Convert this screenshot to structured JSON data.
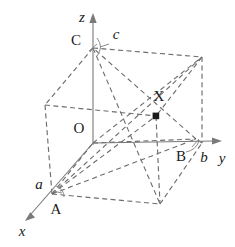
{
  "figure": {
    "background_color": "#ffffff",
    "line_color": "#6d6d6d",
    "axis_color": "#7a7a7a",
    "label_color": "#1c1c1c",
    "point_color": "#1a1a1a"
  },
  "axes": [
    {
      "id": "axis-x",
      "label": "x",
      "style": "italic",
      "label_x": 22,
      "label_y": 233,
      "from": [
        93,
        143
      ],
      "to": [
        27,
        219
      ],
      "arrow": true
    },
    {
      "id": "axis-y",
      "label": "y",
      "style": "italic",
      "label_x": 222,
      "label_y": 160,
      "from": [
        93,
        143
      ],
      "to": [
        222,
        141
      ],
      "arrow": true
    },
    {
      "id": "axis-z",
      "label": "z",
      "style": "italic",
      "label_x": 82,
      "label_y": 19,
      "from": [
        93,
        143
      ],
      "to": [
        93,
        15
      ],
      "arrow": true
    }
  ],
  "origin": {
    "label": "O",
    "x": 93,
    "y": 143,
    "label_x": 79,
    "label_y": 130
  },
  "vertices": [
    {
      "id": "A",
      "label": "A",
      "x": 52,
      "y": 194,
      "label_x": 56,
      "label_y": 211,
      "dot": false
    },
    {
      "id": "B",
      "label": "B",
      "x": 196,
      "y": 139,
      "label_x": 181,
      "label_y": 158,
      "dot": false
    },
    {
      "id": "C",
      "label": "C",
      "x": 93,
      "y": 48,
      "label_x": 76,
      "label_y": 42,
      "dot": false
    },
    {
      "id": "X",
      "label": "X",
      "x": 156,
      "y": 116,
      "label_x": 159,
      "label_y": 98,
      "dot": true
    }
  ],
  "lattice_parameters": [
    {
      "id": "a",
      "label": "a",
      "style": "italic",
      "label_x": 39,
      "label_y": 186,
      "axis": "x"
    },
    {
      "id": "b",
      "label": "b",
      "style": "italic",
      "label_x": 204,
      "label_y": 159,
      "axis": "y"
    },
    {
      "id": "c",
      "label": "c",
      "style": "italic",
      "label_x": 116,
      "label_y": 36,
      "axis": "z"
    }
  ],
  "cube": {
    "description": "Parallelepiped unit cell drawn with dashed edges",
    "corners": {
      "origin_O": [
        93,
        143
      ],
      "A_front_lower_left": [
        52,
        194
      ],
      "B_right_lower": [
        196,
        139
      ],
      "C_top": [
        93,
        48
      ],
      "back_left": [
        45,
        105
      ],
      "top_right_back": [
        202,
        57
      ],
      "top_front_right": [
        156,
        116
      ],
      "front_bottom_right": [
        160,
        204
      ],
      "bottom_right_back": [
        202,
        143
      ]
    }
  },
  "markers": [
    {
      "id": "tick-c",
      "kind": "arc",
      "near": "C",
      "cx": 99,
      "cy": 47
    },
    {
      "id": "tick-b",
      "kind": "arc",
      "near": "B",
      "cx": 192,
      "cy": 146
    },
    {
      "id": "tick-a",
      "kind": "arc",
      "near": "A",
      "cx": 60,
      "cy": 192
    }
  ]
}
